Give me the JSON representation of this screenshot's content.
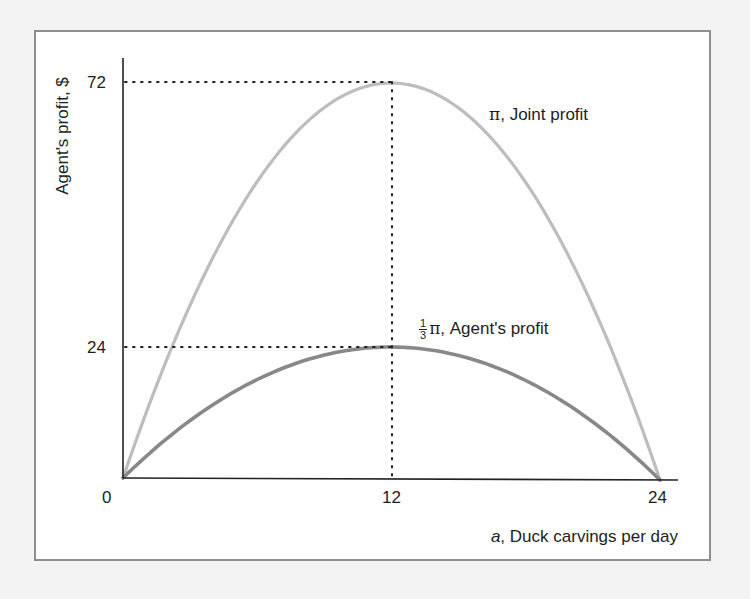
{
  "chart_data": {
    "type": "line",
    "title": "",
    "xlabel_var": "a",
    "xlabel_text": ", Duck carvings per day",
    "ylabel": "Agent's profit, $",
    "xlim": [
      0,
      24
    ],
    "ylim": [
      0,
      72
    ],
    "x_ticks": [
      "0",
      "12",
      "24"
    ],
    "y_ticks": [
      "24",
      "72"
    ],
    "grid": false,
    "legend_position": "inline labels",
    "series": [
      {
        "name": "π, Joint profit",
        "color": "#bdbdbd",
        "formula": "pi = a(24 - a)/2",
        "x": [
          0,
          2,
          4,
          6,
          8,
          10,
          12,
          14,
          16,
          18,
          20,
          22,
          24
        ],
        "values": [
          0,
          22,
          40,
          54,
          64,
          70,
          72,
          70,
          64,
          54,
          40,
          22,
          0
        ]
      },
      {
        "name": "1/3 π, Agent's profit",
        "color": "#888888",
        "formula": "pi/3",
        "x": [
          0,
          2,
          4,
          6,
          8,
          10,
          12,
          14,
          16,
          18,
          20,
          22,
          24
        ],
        "values": [
          0,
          7.33,
          13.33,
          18,
          21.33,
          23.33,
          24,
          23.33,
          21.33,
          18,
          13.33,
          7.33,
          0
        ]
      }
    ],
    "annotations": [
      {
        "type": "dotted-hline",
        "y": 72,
        "x_to": 12
      },
      {
        "type": "dotted-hline",
        "y": 24,
        "x_to": 12
      },
      {
        "type": "dotted-vline",
        "x": 12,
        "y_to": 72
      }
    ]
  },
  "labels": {
    "ylabel": "Agent's profit, $",
    "ytick_72": "72",
    "ytick_24": "24",
    "xtick_0": "0",
    "xtick_12": "12",
    "xtick_24": "24",
    "xlabel_var": "a",
    "xlabel_text": ", Duck carvings per day",
    "joint_pi": "π",
    "joint_text": ", Joint profit",
    "agent_num": "1",
    "agent_den": "3",
    "agent_pi": "π",
    "agent_text": ", Agent's profit"
  }
}
